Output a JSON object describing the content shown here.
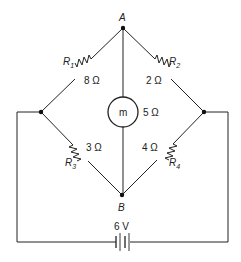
{
  "diagram": {
    "type": "wheatstone-bridge circuit",
    "nodes": {
      "top": "A",
      "bottom": "B"
    },
    "resistors": [
      {
        "name": "R",
        "sub": "1",
        "value": "8 Ω"
      },
      {
        "name": "R",
        "sub": "2",
        "value": "2 Ω"
      },
      {
        "name": "R",
        "sub": "3",
        "value": "3 Ω"
      },
      {
        "name": "R",
        "sub": "4",
        "value": "4 Ω"
      }
    ],
    "meter": {
      "symbol": "m",
      "value": "5 Ω"
    },
    "battery": {
      "value": "6 V"
    }
  }
}
